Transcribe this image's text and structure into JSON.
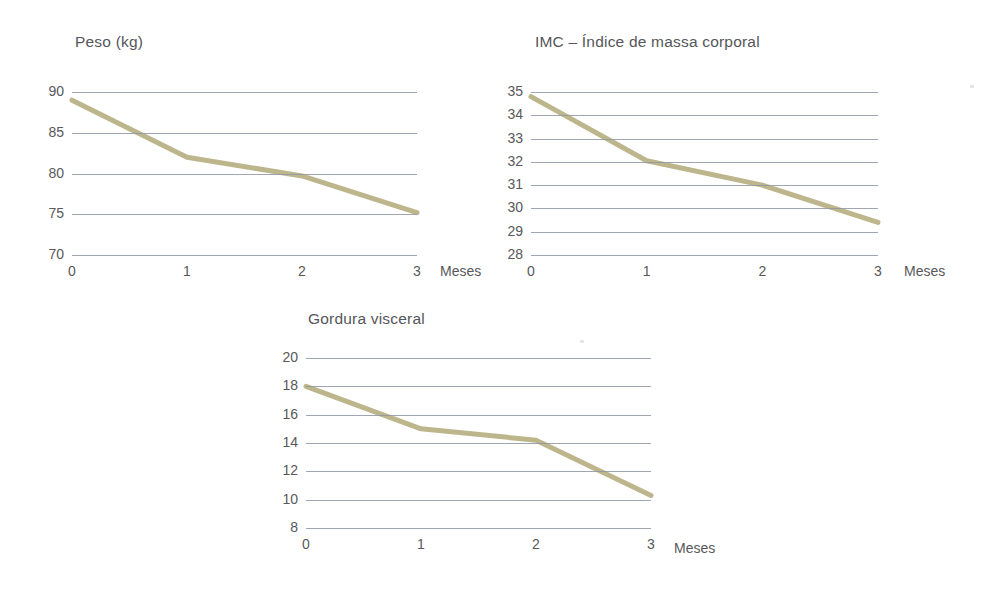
{
  "page": {
    "background_color": "#ffffff",
    "text_color": "#58585a",
    "gridline_color": "#8f96a3",
    "series_color": "#bdb68c"
  },
  "charts": [
    {
      "id": "peso",
      "title": "Peso (kg)",
      "xlabel": "Meses",
      "ylabel": "",
      "ytick_labels": [
        "90",
        "85",
        "80",
        "75",
        "70"
      ],
      "xtick_labels": [
        "0",
        "1",
        "2",
        "3"
      ]
    },
    {
      "id": "imc",
      "title": "IMC – Índice de massa corporal",
      "xlabel": "Meses",
      "ylabel": "",
      "ytick_labels": [
        "35",
        "34",
        "33",
        "32",
        "31",
        "30",
        "29",
        "28"
      ],
      "xtick_labels": [
        "0",
        "1",
        "2",
        "3"
      ]
    },
    {
      "id": "gordura",
      "title": "Gordura visceral",
      "xlabel": "Meses",
      "ylabel": "",
      "ytick_labels": [
        "20",
        "18",
        "16",
        "14",
        "12",
        "10",
        "8"
      ],
      "xtick_labels": [
        "0",
        "1",
        "2",
        "3"
      ]
    }
  ],
  "chart_data": [
    {
      "type": "line",
      "id": "peso",
      "title": "Peso (kg)",
      "xlabel": "Meses",
      "ylabel": "Peso (kg)",
      "x": [
        0,
        1,
        2,
        3
      ],
      "xticks": [
        0,
        1,
        2,
        3
      ],
      "yticks": [
        70,
        75,
        80,
        85,
        90
      ],
      "xlim": [
        0,
        3
      ],
      "ylim": [
        70,
        90
      ],
      "values": [
        89,
        82,
        79.7,
        75.2
      ],
      "series": [
        {
          "name": "Peso (kg)",
          "values": [
            89,
            82,
            79.7,
            75.2
          ]
        }
      ],
      "grid": true,
      "legend": false,
      "line_color": "#bdb68c"
    },
    {
      "type": "line",
      "id": "imc",
      "title": "IMC – Índice de massa corporal",
      "xlabel": "Meses",
      "ylabel": "IMC",
      "x": [
        0,
        1,
        2,
        3
      ],
      "xticks": [
        0,
        1,
        2,
        3
      ],
      "yticks": [
        28,
        29,
        30,
        31,
        32,
        33,
        34,
        35
      ],
      "xlim": [
        0,
        3
      ],
      "ylim": [
        28,
        35
      ],
      "values": [
        34.8,
        32.05,
        31.0,
        29.4
      ],
      "series": [
        {
          "name": "IMC",
          "values": [
            34.8,
            32.05,
            31.0,
            29.4
          ]
        }
      ],
      "grid": true,
      "legend": false,
      "line_color": "#bdb68c"
    },
    {
      "type": "line",
      "id": "gordura",
      "title": "Gordura visceral",
      "xlabel": "Meses",
      "ylabel": "Gordura visceral",
      "x": [
        0,
        1,
        2,
        3
      ],
      "xticks": [
        0,
        1,
        2,
        3
      ],
      "yticks": [
        8,
        10,
        12,
        14,
        16,
        18,
        20
      ],
      "xlim": [
        0,
        3
      ],
      "ylim": [
        8,
        20
      ],
      "values": [
        18,
        15,
        14.2,
        10.3
      ],
      "series": [
        {
          "name": "Gordura visceral",
          "values": [
            18,
            15,
            14.2,
            10.3
          ]
        }
      ],
      "grid": true,
      "legend": false,
      "line_color": "#bdb68c"
    }
  ]
}
